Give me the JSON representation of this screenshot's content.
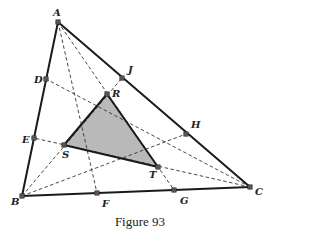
{
  "figure": {
    "caption": "Figure 93",
    "colors": {
      "stroke": "#1a1a1a",
      "dashed": "#333333",
      "fill": "#b9b9b9",
      "point": "#555555"
    },
    "points": {
      "A": {
        "label": "A",
        "x": 58,
        "y": 22
      },
      "B": {
        "label": "B",
        "x": 22,
        "y": 196
      },
      "C": {
        "label": "C",
        "x": 250,
        "y": 187
      },
      "D": {
        "label": "D",
        "x": 46,
        "y": 79
      },
      "E": {
        "label": "E",
        "x": 34,
        "y": 138
      },
      "F": {
        "label": "F",
        "x": 97,
        "y": 193
      },
      "G": {
        "label": "G",
        "x": 174,
        "y": 190
      },
      "H": {
        "label": "H",
        "x": 186,
        "y": 134
      },
      "J": {
        "label": "J",
        "x": 122,
        "y": 78
      },
      "R": {
        "label": "R",
        "x": 107,
        "y": 94
      },
      "S": {
        "label": "S",
        "x": 64,
        "y": 145
      },
      "T": {
        "label": "T",
        "x": 158,
        "y": 167
      }
    },
    "solid_segments": [
      [
        "A",
        "B"
      ],
      [
        "B",
        "C"
      ],
      [
        "C",
        "A"
      ],
      [
        "R",
        "S"
      ],
      [
        "S",
        "T"
      ],
      [
        "T",
        "R"
      ]
    ],
    "dashed_segments": [
      [
        "A",
        "F"
      ],
      [
        "A",
        "G"
      ],
      [
        "B",
        "H"
      ],
      [
        "B",
        "J"
      ],
      [
        "C",
        "D"
      ],
      [
        "C",
        "E"
      ]
    ],
    "shaded_triangle": [
      "R",
      "S",
      "T"
    ]
  }
}
